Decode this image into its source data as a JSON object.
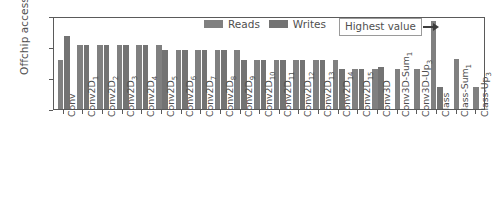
{
  "chart_data": {
    "type": "bar",
    "title": "",
    "xlabel": "",
    "ylabel": "Offchip accesses",
    "yscale": "log",
    "ylim": [
      10,
      10000000
    ],
    "ytick_labels": [
      "10⁷",
      "10⁵",
      "10³",
      "10¹"
    ],
    "ytick_values": [
      10000000,
      100000,
      1000,
      10
    ],
    "grid": false,
    "legend_position": "upper center",
    "categories": [
      "Conv",
      "Conv2D1",
      "Conv2D2",
      "Conv2D3",
      "Conv2D4",
      "Conv2D5",
      "Conv2D6",
      "Conv2D7",
      "Conv2D8",
      "Conv2D9",
      "Conv2D10",
      "Conv2D11",
      "Conv2D12",
      "Conv2D13",
      "Conv2D14",
      "Conv2D15",
      "Conv3D",
      "Conv3D-Sum1",
      "Conv3D-Up3",
      "Class",
      "Class-Sum1",
      "Class-Up3"
    ],
    "category_labels": [
      {
        "base": "Conv",
        "sub": ""
      },
      {
        "base": "Conv2D",
        "sub": "1"
      },
      {
        "base": "Conv2D",
        "sub": "2"
      },
      {
        "base": "Conv2D",
        "sub": "3"
      },
      {
        "base": "Conv2D",
        "sub": "4"
      },
      {
        "base": "Conv2D",
        "sub": "5"
      },
      {
        "base": "Conv2D",
        "sub": "6"
      },
      {
        "base": "Conv2D",
        "sub": "7"
      },
      {
        "base": "Conv2D",
        "sub": "8"
      },
      {
        "base": "Conv2D",
        "sub": "9"
      },
      {
        "base": "Conv2D",
        "sub": "10"
      },
      {
        "base": "Conv2D",
        "sub": "11"
      },
      {
        "base": "Conv2D",
        "sub": "12"
      },
      {
        "base": "Conv2D",
        "sub": "13"
      },
      {
        "base": "Conv2D",
        "sub": "14"
      },
      {
        "base": "Conv2D",
        "sub": "15"
      },
      {
        "base": "Conv3D",
        "sub": ""
      },
      {
        "base": "Conv3D-Sum",
        "sub": "1"
      },
      {
        "base": "Conv3D-Up",
        "sub": "3"
      },
      {
        "base": "Class",
        "sub": ""
      },
      {
        "base": "Class-Sum",
        "sub": "1"
      },
      {
        "base": "Class-Up",
        "sub": "3"
      }
    ],
    "series": [
      {
        "name": "Reads",
        "color": "#808080",
        "values": [
          14000,
          130000,
          130000,
          130000,
          130000,
          130000,
          65000,
          65000,
          65000,
          65000,
          15000,
          15000,
          15000,
          15000,
          15000,
          3800,
          3800,
          3800,
          3800,
          5000000,
          16000,
          280
        ]
      },
      {
        "name": "Writes",
        "color": "#737373",
        "values": [
          500000,
          130000,
          130000,
          130000,
          130000,
          65000,
          65000,
          65000,
          65000,
          15000,
          15000,
          15000,
          15000,
          15000,
          3800,
          3800,
          5500,
          null,
          null,
          280,
          null,
          null
        ]
      }
    ],
    "annotations": [
      {
        "text": "Highest value",
        "points_to_category": "Class",
        "points_to_series": "Reads",
        "points_to_value": 5000000
      }
    ]
  },
  "legend": {
    "items": [
      {
        "label": "Reads",
        "color": "#808080"
      },
      {
        "label": "Writes",
        "color": "#737373"
      }
    ]
  },
  "annotation": {
    "label": "Highest value"
  },
  "axes": {
    "ylabel": "Offchip accesses"
  },
  "colors": {
    "reads": "#808080",
    "writes": "#737373",
    "frame": "#5a5a5a",
    "text": "#4f4f4f",
    "arrow": "#3d3d3d",
    "background": "#ffffff"
  }
}
